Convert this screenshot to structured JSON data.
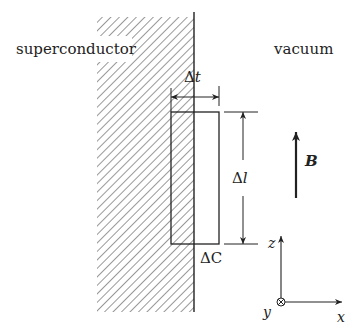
{
  "labels": {
    "superconductor": "superconductor",
    "vacuum": "vacuum",
    "delta_t": "Δt",
    "delta_l": "Δl",
    "delta_c": "ΔC",
    "field": "B",
    "axis_z": "z",
    "axis_x": "x",
    "axis_y": "y"
  },
  "colors": {
    "stroke": "#222222",
    "hatch": "#444444",
    "background": "#ffffff"
  }
}
